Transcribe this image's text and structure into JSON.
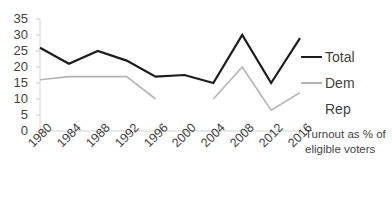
{
  "chart_data": {
    "type": "line",
    "title": "",
    "xlabel": "",
    "ylabel": "",
    "annotation": "Turnout as % of eligible voters",
    "categories": [
      "1980",
      "1984",
      "1988",
      "1992",
      "1996",
      "2000",
      "2004",
      "2008",
      "2012",
      "2016"
    ],
    "ylim": [
      0,
      35
    ],
    "ytick_step": 5,
    "yticks": [
      "0",
      "5",
      "10",
      "15",
      "20",
      "25",
      "30",
      "35"
    ],
    "grid": false,
    "legend_position": "right",
    "series": [
      {
        "name": "Total",
        "color": "#1c1c1c",
        "width": 2.2,
        "values": [
          26,
          21,
          25,
          22,
          17,
          17.5,
          15,
          30,
          15,
          29
        ]
      },
      {
        "name": "Dem",
        "color": "#b4b4b4",
        "width": 1.6,
        "values": [
          16,
          17,
          17,
          17,
          10,
          null,
          10,
          20,
          6.5,
          12
        ]
      },
      {
        "name": "Rep",
        "color": "#ffffff",
        "width": 0,
        "values": [
          null,
          null,
          null,
          null,
          null,
          null,
          null,
          null,
          null,
          null
        ]
      }
    ]
  },
  "legend": {
    "items": [
      {
        "label": "Total",
        "marker": "line-dark"
      },
      {
        "label": "Dem",
        "marker": "line-gray"
      },
      {
        "label": "Rep",
        "marker": "none"
      }
    ]
  },
  "axis": {
    "color": "#d0d0d0",
    "tick_color": "#c8c8c8"
  }
}
